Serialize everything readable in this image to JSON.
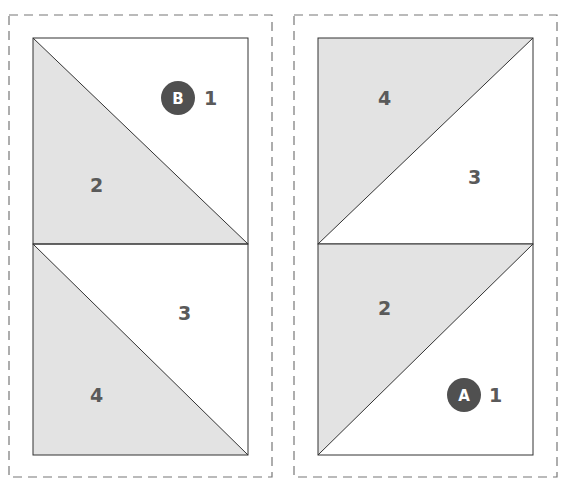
{
  "colors": {
    "shaded": "#e3e3e3",
    "line": "#333333",
    "dash": "#777777",
    "label": "#5a5a5a",
    "badge": "#505050",
    "badge_text": "#ffffff"
  },
  "panels": [
    {
      "id": "B",
      "badge": "B",
      "units": [
        {
          "position": "top",
          "diagonal": "top-left-to-bottom-right",
          "shaded_piece": "bottom-left",
          "labels": {
            "upper_right": "1",
            "lower_left": "2"
          }
        },
        {
          "position": "bottom",
          "diagonal": "top-left-to-bottom-right",
          "shaded_piece": "bottom-left",
          "labels": {
            "upper_right": "3",
            "lower_left": "4"
          }
        }
      ]
    },
    {
      "id": "A",
      "badge": "A",
      "units": [
        {
          "position": "top",
          "diagonal": "bottom-left-to-top-right",
          "shaded_piece": "top-left",
          "labels": {
            "upper_left": "4",
            "lower_right": "3"
          }
        },
        {
          "position": "bottom",
          "diagonal": "bottom-left-to-top-right",
          "shaded_piece": "top-left",
          "labels": {
            "upper_left": "2",
            "lower_right": "1"
          }
        }
      ]
    }
  ]
}
